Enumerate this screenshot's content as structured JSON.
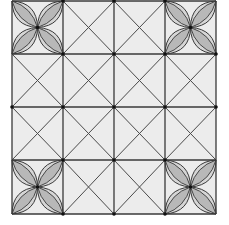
{
  "figure": {
    "background": "#ffffff",
    "cell_fill": "#ececec",
    "line_color": "#3a3a3a",
    "petal_fill_outer": "#d6d6d6",
    "petal_fill_inner": "#b8b8b8",
    "dot_color": "#111111",
    "grid": {
      "rows": 4,
      "cols": 4,
      "x_lines": [
        12,
        63,
        114,
        165,
        216
      ],
      "y_lines": [
        1,
        54,
        107,
        160,
        214
      ]
    },
    "flower_cells": [
      {
        "row": 0,
        "col": 0
      },
      {
        "row": 0,
        "col": 3
      },
      {
        "row": 3,
        "col": 0
      },
      {
        "row": 3,
        "col": 3
      }
    ],
    "dots": [
      [
        63,
        54
      ],
      [
        114,
        54
      ],
      [
        165,
        54
      ],
      [
        216,
        54
      ],
      [
        12,
        107
      ],
      [
        63,
        107
      ],
      [
        114,
        107
      ],
      [
        165,
        107
      ],
      [
        216,
        107
      ],
      [
        63,
        160
      ],
      [
        114,
        160
      ],
      [
        165,
        160
      ],
      [
        63,
        214
      ],
      [
        114,
        214
      ],
      [
        165,
        214
      ],
      [
        63,
        1
      ],
      [
        114,
        1
      ],
      [
        165,
        1
      ]
    ]
  }
}
